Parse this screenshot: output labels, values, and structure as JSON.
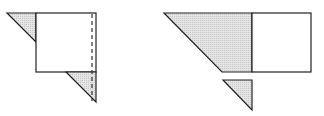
{
  "diagram": {
    "colors": {
      "stroke": "#222222",
      "shade": "#d9d9d9",
      "background": "#ffffff"
    },
    "left_figure": {
      "square": {
        "x": 36,
        "y": 13,
        "w": 60,
        "h": 59
      },
      "triangles": [
        {
          "name": "top-left-triangle",
          "points": "7,13 36,13 36,42",
          "shaded": true
        },
        {
          "name": "bottom-right-triangle",
          "points": "66,72 96,72 96,102",
          "shaded": true
        }
      ],
      "dashed_line": {
        "x1": 92,
        "y1": 13,
        "x2": 92,
        "y2": 102
      }
    },
    "right_figure": {
      "trapezoid": {
        "points": "164,13 252,13 252,72 222,72",
        "shaded": true
      },
      "square": {
        "x": 252,
        "y": 13,
        "w": 59,
        "h": 59
      },
      "small_triangle": {
        "points": "223,80 252,80 252,110",
        "shaded": true
      }
    }
  }
}
